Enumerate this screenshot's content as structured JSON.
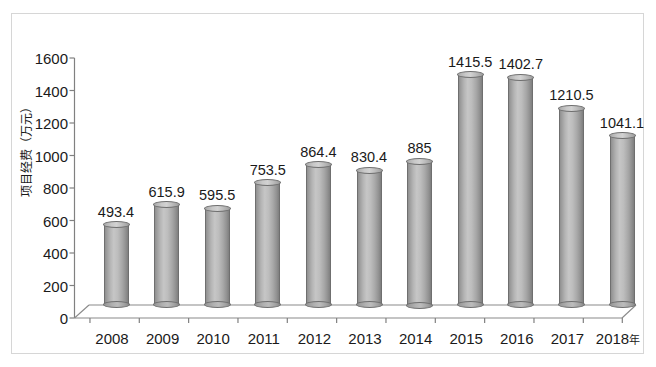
{
  "chart_data": {
    "type": "bar",
    "title": "",
    "subtitle": "",
    "xlabel": "",
    "ylabel": "项目经费（万元）",
    "x_axis_unit_suffix": "年",
    "categories": [
      "2008",
      "2009",
      "2010",
      "2011",
      "2012",
      "2013",
      "2014",
      "2015",
      "2016",
      "2017",
      "2018"
    ],
    "values": [
      493.4,
      615.9,
      595.5,
      753.5,
      864.4,
      830.4,
      885,
      1415.5,
      1402.7,
      1210.5,
      1041.1
    ],
    "value_labels": [
      "493.4",
      "615.9",
      "595.5",
      "753.5",
      "864.4",
      "830.4",
      "885",
      "1415.5",
      "1402.7",
      "1210.5",
      "1041.1"
    ],
    "ylim": [
      0,
      1600
    ],
    "y_ticks": [
      0,
      200,
      400,
      600,
      800,
      1000,
      1200,
      1400,
      1600
    ],
    "y_tick_labels": [
      "0",
      "200",
      "400",
      "600",
      "800",
      "1000",
      "1200",
      "1400",
      "1600"
    ],
    "grid": false,
    "legend": null,
    "legend_position": "none",
    "style": "3d-cylinder",
    "series": [
      {
        "name": "项目经费",
        "values": [
          493.4,
          615.9,
          595.5,
          753.5,
          864.4,
          830.4,
          885,
          1415.5,
          1402.7,
          1210.5,
          1041.1
        ]
      }
    ],
    "colors": {
      "bar_light": "#c6c6c6",
      "bar_mid": "#aaaaaa",
      "bar_dark": "#7f7f7f",
      "bar_outline": "#6f6f6f",
      "axis": "#808080",
      "text": "#1a1a1a",
      "frame": "#d6d6d6",
      "background": "#ffffff"
    }
  }
}
